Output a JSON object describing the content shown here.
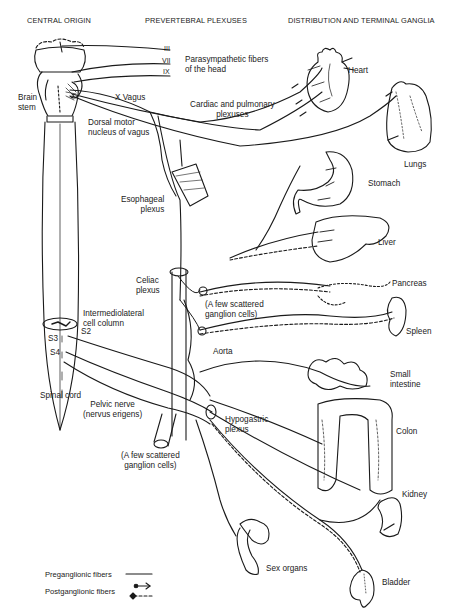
{
  "headers": {
    "central_origin": "CENTRAL ORIGIN",
    "prevertebral": "PREVERTEBRAL PLEXUSES",
    "distribution": "DISTRIBUTION AND TERMINAL GANGLIA"
  },
  "cranial_nerves": [
    "III",
    "VII",
    "IX"
  ],
  "labels": {
    "parasympathetic_head_1": "Parasympathetic fibers",
    "parasympathetic_head_2": "of the head",
    "brain_stem_1": "Brain",
    "brain_stem_2": "stem",
    "x_vagus": "X Vagus",
    "dorsal_motor_1": "Dorsal motor",
    "dorsal_motor_2": "nucleus of vagus",
    "cardiac_1": "Cardiac and pulmonary",
    "cardiac_2": "plexuses",
    "esophageal_1": "Esophageal",
    "esophageal_2": "plexus",
    "celiac_1": "Celiac",
    "celiac_2": "plexus",
    "scattered_upper_1": "(A few scattered",
    "scattered_upper_2": "ganglion cells)",
    "intermediolateral_1": "Intermediolateral",
    "intermediolateral_2": "cell column",
    "s2": "S2",
    "s3": "S3",
    "s4": "S4",
    "aorta": "Aorta",
    "spinal_cord": "Spinal cord",
    "pelvic_nerve_1": "Pelvic nerve",
    "pelvic_nerve_2": "(nervus erigens)",
    "hypogastric_1": "Hypogastric",
    "hypogastric_2": "plexus",
    "scattered_lower_1": "(A few scattered",
    "scattered_lower_2": "ganglion cells)"
  },
  "organs": {
    "heart": "Heart",
    "lungs": "Lungs",
    "stomach": "Stomach",
    "liver": "Liver",
    "pancreas": "Pancreas",
    "spleen": "Spleen",
    "small_intestine_1": "Small",
    "small_intestine_2": "intestine",
    "colon": "Colon",
    "kidney": "Kidney",
    "bladder": "Bladder",
    "sex_organs": "Sex organs"
  },
  "legend": {
    "preganglionic": "Preganglionic fibers",
    "postganglionic": "Postganglionic fibers"
  },
  "colors": {
    "ink": "#1a1a1a",
    "background": "#ffffff"
  }
}
